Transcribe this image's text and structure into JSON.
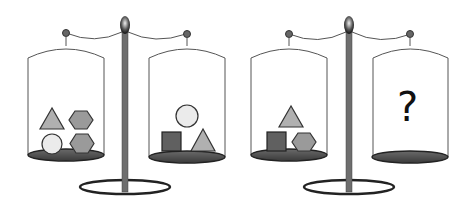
{
  "puzzle": {
    "type": "balance-scale-equivalence",
    "scales": [
      {
        "id": "scale-1",
        "left_pan": [
          "triangle",
          "hexagon",
          "circle",
          "hexagon"
        ],
        "right_pan": [
          "circle",
          "square",
          "triangle"
        ]
      },
      {
        "id": "scale-2",
        "left_pan": [
          "triangle",
          "square",
          "hexagon"
        ],
        "right_pan": [],
        "right_label": "?"
      }
    ]
  },
  "colors": {
    "triangle": "#b0b0b0",
    "hexagon": "#9a9a9a",
    "circle": "#ebebeb",
    "square": "#606060",
    "pan": "#555555",
    "pole": "#6e6e6e",
    "outline": "#333333"
  }
}
